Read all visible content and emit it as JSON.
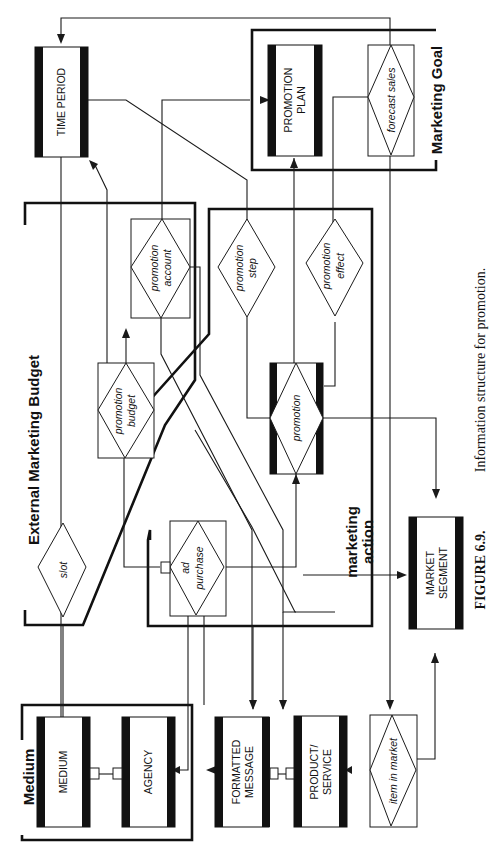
{
  "figure": {
    "caption_label": "FIGURE 6.9.",
    "caption_text": "Information structure for promotion."
  },
  "groups": {
    "external_marketing_budget": "External Marketing Budget",
    "marketing_goal": "Marketing Goal",
    "marketing_action_line1": "marketing",
    "marketing_action_line2": "action",
    "medium": "Medium"
  },
  "entities": {
    "time_period": [
      "TIME PERIOD"
    ],
    "promotion_plan": [
      "PROMOTION",
      "PLAN"
    ],
    "medium": [
      "MEDIUM"
    ],
    "agency": [
      "AGENCY"
    ],
    "formatted_message": [
      "FORMATTED",
      "MESSAGE"
    ],
    "product_service": [
      "PRODUCT/",
      "SERVICE"
    ],
    "market_segment": [
      "MARKET",
      "SEGMENT"
    ],
    "promotion": [
      "promotion"
    ]
  },
  "relationships": {
    "forecast_sales": [
      "forecast sales"
    ],
    "promotion_account": [
      "promotion",
      "account"
    ],
    "promotion_budget": [
      "promotion",
      "budget"
    ],
    "promotion_step": [
      "promotion",
      "step"
    ],
    "promotion_effect": [
      "promotion",
      "effect"
    ],
    "slot": [
      "slot"
    ],
    "ad_purchase": [
      "ad",
      "purchase"
    ],
    "item_in_market": [
      "item in market"
    ]
  }
}
